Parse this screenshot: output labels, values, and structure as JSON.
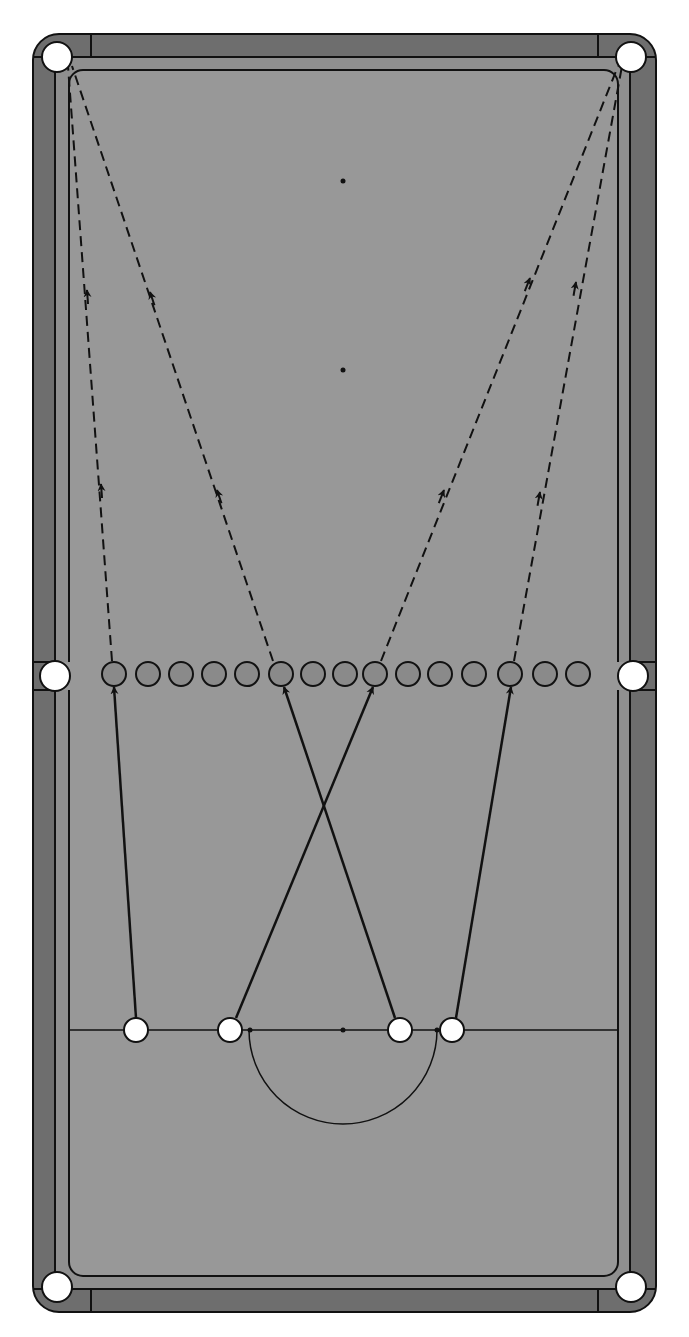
{
  "diagram": {
    "colors": {
      "rail": "#6e6e6e",
      "cushion": "#8f8f8f",
      "cloth": "#989898",
      "line": "#111111",
      "pocket": "#ffffff",
      "object_ball": "#8a8a8a",
      "cue_ball": "#ffffff"
    },
    "table": {
      "x": 33,
      "y": 34,
      "width": 623,
      "height": 1278,
      "corner_radius": 26
    },
    "spots": [
      {
        "name": "black-spot",
        "x": 343,
        "y": 181
      },
      {
        "name": "pink-spot",
        "x": 343,
        "y": 370
      },
      {
        "name": "brown-spot",
        "x": 343,
        "y": 1030
      },
      {
        "name": "yellow-spot",
        "x": 250,
        "y": 1030
      },
      {
        "name": "green-spot",
        "x": 437,
        "y": 1030
      }
    ],
    "baulk_line": {
      "y": 1030,
      "x1": 69,
      "x2": 618
    },
    "d": {
      "cx": 343,
      "cy": 1030,
      "r": 94
    },
    "pockets": [
      {
        "name": "top-left-pocket",
        "x": 57,
        "y": 57
      },
      {
        "name": "top-right-pocket",
        "x": 631,
        "y": 57
      },
      {
        "name": "middle-left-pocket",
        "x": 55,
        "y": 676
      },
      {
        "name": "middle-right-pocket",
        "x": 633,
        "y": 676
      },
      {
        "name": "bottom-left-pocket",
        "x": 57,
        "y": 1287
      },
      {
        "name": "bottom-right-pocket",
        "x": 631,
        "y": 1287
      }
    ],
    "object_balls": [
      {
        "x": 114,
        "y": 674
      },
      {
        "x": 148,
        "y": 674
      },
      {
        "x": 181,
        "y": 674
      },
      {
        "x": 214,
        "y": 674
      },
      {
        "x": 247,
        "y": 674
      },
      {
        "x": 281,
        "y": 674
      },
      {
        "x": 313,
        "y": 674
      },
      {
        "x": 345,
        "y": 674
      },
      {
        "x": 375,
        "y": 674
      },
      {
        "x": 408,
        "y": 674
      },
      {
        "x": 440,
        "y": 674
      },
      {
        "x": 474,
        "y": 674
      },
      {
        "x": 510,
        "y": 674
      },
      {
        "x": 545,
        "y": 674
      },
      {
        "x": 578,
        "y": 674
      }
    ],
    "ball_radius": 12,
    "cue_balls": [
      {
        "x": 136,
        "y": 1030
      },
      {
        "x": 230,
        "y": 1030
      },
      {
        "x": 400,
        "y": 1030
      },
      {
        "x": 452,
        "y": 1030
      }
    ],
    "cue_paths": [
      {
        "from": [
          136,
          1018
        ],
        "to": [
          114,
          687
        ]
      },
      {
        "from": [
          236,
          1018
        ],
        "to": [
          373,
          687
        ]
      },
      {
        "from": [
          395,
          1018
        ],
        "to": [
          284,
          687
        ]
      },
      {
        "from": [
          456,
          1018
        ],
        "to": [
          511,
          687
        ]
      }
    ],
    "object_paths": [
      {
        "from": [
          112,
          661
        ],
        "to": [
          68,
          66
        ],
        "arrows": [
          [
            101,
            484
          ],
          [
            87,
            290
          ]
        ]
      },
      {
        "from": [
          273,
          661
        ],
        "to": [
          72,
          66
        ],
        "arrows": [
          [
            217,
            490
          ],
          [
            150,
            292
          ]
        ]
      },
      {
        "from": [
          381,
          661
        ],
        "to": [
          618,
          66
        ],
        "arrows": [
          [
            444,
            490
          ],
          [
            530,
            278
          ]
        ]
      },
      {
        "from": [
          514,
          661
        ],
        "to": [
          622,
          66
        ],
        "arrows": [
          [
            540,
            492
          ],
          [
            576,
            282
          ]
        ]
      }
    ]
  }
}
